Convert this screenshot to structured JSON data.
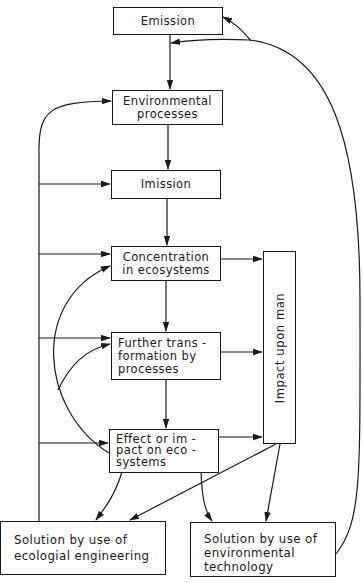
{
  "diagram": {
    "type": "flowchart",
    "nodes": {
      "emission": {
        "lines": [
          "Emission"
        ]
      },
      "environmental_processes": {
        "lines": [
          "Environmental",
          "processes"
        ]
      },
      "imission": {
        "lines": [
          "Imission"
        ]
      },
      "concentration": {
        "lines": [
          "Concentration",
          "in ecosystems"
        ]
      },
      "further_transformation": {
        "lines": [
          "Further trans -",
          "formation by",
          "processes"
        ]
      },
      "effect": {
        "lines": [
          "Effect or im -",
          "pact on eco -",
          "systems"
        ]
      },
      "impact_upon_man": {
        "label": "Impact upon man"
      },
      "solution_ecological": {
        "lines": [
          "Solution by use of",
          "ecologial engineering"
        ]
      },
      "solution_technology": {
        "lines": [
          "Solution by use of",
          "environmental",
          "technology"
        ]
      }
    },
    "edges": [
      {
        "from": "emission",
        "to": "environmental_processes"
      },
      {
        "from": "environmental_processes",
        "to": "imission"
      },
      {
        "from": "imission",
        "to": "concentration"
      },
      {
        "from": "concentration",
        "to": "further_transformation"
      },
      {
        "from": "further_transformation",
        "to": "effect"
      },
      {
        "from": "concentration",
        "to": "impact_upon_man"
      },
      {
        "from": "further_transformation",
        "to": "impact_upon_man"
      },
      {
        "from": "effect",
        "to": "impact_upon_man"
      },
      {
        "from": "effect",
        "to": "concentration"
      },
      {
        "from": "effect",
        "to": "further_transformation"
      },
      {
        "from": "effect",
        "to": "solution_ecological"
      },
      {
        "from": "effect",
        "to": "solution_technology"
      },
      {
        "from": "impact_upon_man",
        "to": "solution_ecological"
      },
      {
        "from": "impact_upon_man",
        "to": "solution_technology"
      },
      {
        "from": "solution_ecological",
        "to": "environmental_processes"
      },
      {
        "from": "solution_ecological",
        "to": "imission"
      },
      {
        "from": "solution_ecological",
        "to": "concentration"
      },
      {
        "from": "solution_ecological",
        "to": "further_transformation"
      },
      {
        "from": "solution_ecological",
        "to": "effect"
      },
      {
        "from": "solution_technology",
        "to": "emission"
      },
      {
        "from": "solution_technology",
        "to": "environmental_processes"
      }
    ],
    "colors": {
      "ink": "#1a1a1a",
      "background": "#ffffff"
    }
  }
}
